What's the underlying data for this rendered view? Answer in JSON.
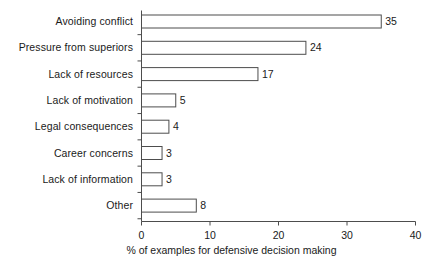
{
  "chart_data": {
    "type": "bar",
    "orientation": "horizontal",
    "title": "",
    "subtitle": "",
    "xlabel": "% of examples for defensive decision making",
    "ylabel": "",
    "categories": [
      "Avoiding conflict",
      "Pressure from superiors",
      "Lack of resources",
      "Lack of motivation",
      "Legal consequences",
      "Career concerns",
      "Lack of information",
      "Other"
    ],
    "values": [
      35,
      24,
      17,
      5,
      4,
      3,
      3,
      8
    ],
    "value_labels": [
      "35",
      "24",
      "17",
      "5",
      "4",
      "3",
      "3",
      "8"
    ],
    "xlim": [
      0,
      40
    ],
    "xticks": [
      0,
      10,
      20,
      30,
      40
    ],
    "xtick_labels": [
      "0",
      "10",
      "20",
      "30",
      "40"
    ],
    "grid": false,
    "legend": null,
    "bar_fill_color": "#ffffff",
    "bar_edge_color": "#4d4d4d",
    "axis_color": "#4d4d4d",
    "text_color": "#1a1a1a"
  }
}
